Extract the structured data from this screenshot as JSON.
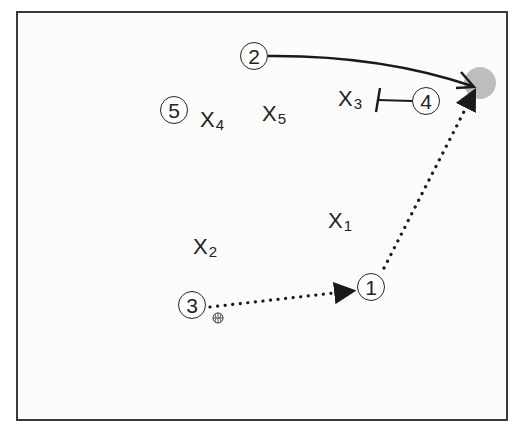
{
  "diagram": {
    "type": "basketball-play",
    "colors": {
      "line": "#1a1a1a",
      "target": "#bdbdbd",
      "border": "#3a3a3a",
      "background": "#fcfcfc"
    },
    "offense": [
      {
        "id": "1",
        "label": "1",
        "x": 371,
        "y": 287
      },
      {
        "id": "2",
        "label": "2",
        "x": 254,
        "y": 56
      },
      {
        "id": "3",
        "label": "3",
        "x": 192,
        "y": 305
      },
      {
        "id": "4",
        "label": "4",
        "x": 426,
        "y": 101
      },
      {
        "id": "5",
        "label": "5",
        "x": 174,
        "y": 110
      }
    ],
    "defense": [
      {
        "id": "X1",
        "letter": "X",
        "sub": "1",
        "x": 328,
        "y": 210
      },
      {
        "id": "X2",
        "letter": "X",
        "sub": "2",
        "x": 193,
        "y": 236
      },
      {
        "id": "X3",
        "letter": "X",
        "sub": "3",
        "x": 338,
        "y": 88
      },
      {
        "id": "X4",
        "letter": "X",
        "sub": "4",
        "x": 200,
        "y": 109
      },
      {
        "id": "X5",
        "letter": "X",
        "sub": "5",
        "x": 262,
        "y": 103
      }
    ],
    "ball_icon": "basketball-icon",
    "target_spot": {
      "x": 480,
      "y": 83,
      "r": 16
    },
    "actions": [
      {
        "type": "cut",
        "from": "2",
        "to": "target",
        "style": "solid-curve"
      },
      {
        "type": "pass",
        "from": "3",
        "to": "1",
        "style": "dotted"
      },
      {
        "type": "pass",
        "from": "1",
        "to": "target",
        "style": "dotted"
      },
      {
        "type": "screen",
        "by": "4",
        "on": "X3",
        "style": "screen-bar"
      }
    ]
  }
}
